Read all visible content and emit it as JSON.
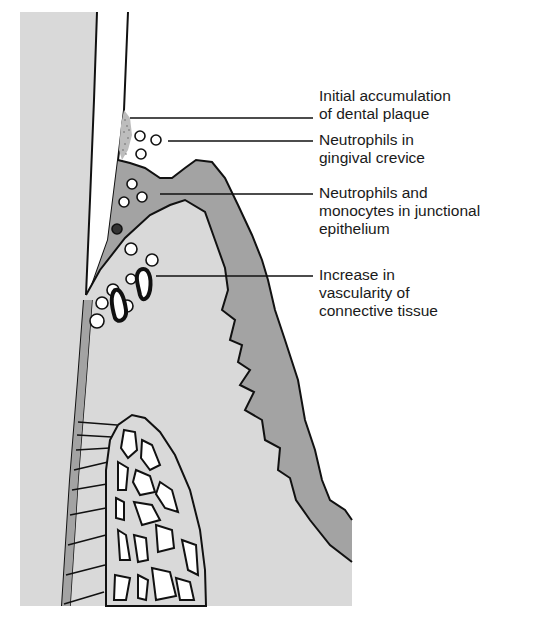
{
  "diagram": {
    "colors": {
      "background": "#ffffff",
      "connective_tissue": "#d9d9d9",
      "epithelium": "#a3a3a3",
      "outline": "#111111",
      "plaque": "#9a9a9a"
    },
    "labels": [
      {
        "id": "plaque",
        "lines": [
          "Initial accumulation",
          "of dental plaque"
        ]
      },
      {
        "id": "crevice-neutrophils",
        "lines": [
          "Neutrophils in",
          "gingival crevice"
        ]
      },
      {
        "id": "junctional-cells",
        "lines": [
          "Neutrophils and",
          "monocytes in junctional",
          "epithelium"
        ]
      },
      {
        "id": "vascularity",
        "lines": [
          "Increase in",
          "vascularity of",
          "connective tissue"
        ]
      }
    ]
  }
}
